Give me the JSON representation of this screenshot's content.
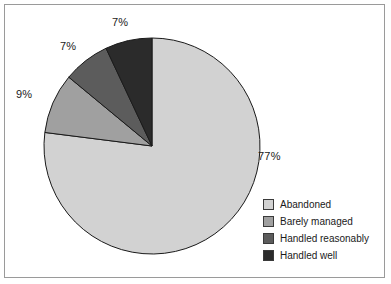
{
  "chart_data": {
    "type": "pie",
    "title": "",
    "subtitle": "",
    "xlabel": "",
    "ylabel": "",
    "legend_position": "bottom-right",
    "grid": false,
    "start_angle_deg": 0,
    "direction": "clockwise",
    "categories": [
      "Abandoned",
      "Barely managed",
      "Handled reasonably",
      "Handled well"
    ],
    "values": [
      77,
      9,
      7,
      7
    ],
    "value_unit": "%",
    "colors": [
      "#d2d2d2",
      "#a0a0a0",
      "#5c5c5c",
      "#2b2b2b"
    ],
    "slices": [
      {
        "label": "Abandoned",
        "value": 77,
        "display": "77%",
        "color": "#d2d2d2"
      },
      {
        "label": "Barely managed",
        "value": 9,
        "display": "9%",
        "color": "#a0a0a0"
      },
      {
        "label": "Handled reasonably",
        "value": 7,
        "display": "7%",
        "color": "#5c5c5c"
      },
      {
        "label": "Handled well",
        "value": 7,
        "display": "7%",
        "color": "#2b2b2b"
      }
    ],
    "annotations": [
      {
        "text": "7%",
        "position": "top"
      },
      {
        "text": "7%",
        "position": "upper-left"
      },
      {
        "text": "9%",
        "position": "left"
      },
      {
        "text": "77%",
        "position": "right"
      }
    ]
  },
  "labels": {
    "pct_top": "7%",
    "pct_upper_left": "7%",
    "pct_left": "9%",
    "pct_right": "77%"
  },
  "legend": {
    "items": [
      {
        "label": "Abandoned",
        "color": "#d2d2d2"
      },
      {
        "label": "Barely managed",
        "color": "#a0a0a0"
      },
      {
        "label": "Handled reasonably",
        "color": "#5c5c5c"
      },
      {
        "label": "Handled well",
        "color": "#2b2b2b"
      }
    ]
  },
  "style": {
    "background": "#ffffff",
    "border_color": "#9a9a9a",
    "outline_color": "#1a1a1a",
    "text_color": "#1a1a1a"
  }
}
